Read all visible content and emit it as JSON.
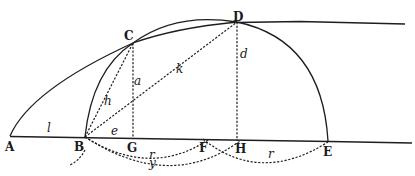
{
  "diagram": {
    "type": "geometric-construction",
    "points": [
      {
        "id": "A",
        "label": "A",
        "x": 10,
        "y": 137
      },
      {
        "id": "B",
        "label": "B",
        "x": 85,
        "y": 137
      },
      {
        "id": "G",
        "label": "G",
        "x": 133,
        "y": 139
      },
      {
        "id": "F",
        "label": "F",
        "x": 206,
        "y": 139
      },
      {
        "id": "H",
        "label": "H",
        "x": 237,
        "y": 141
      },
      {
        "id": "E",
        "label": "E",
        "x": 327,
        "y": 142
      },
      {
        "id": "C",
        "label": "C",
        "x": 133,
        "y": 43
      },
      {
        "id": "D",
        "label": "D",
        "x": 237,
        "y": 22
      }
    ],
    "segment_labels": {
      "l": "l",
      "e": "e",
      "a": "a",
      "h": "h",
      "k": "k",
      "d": "d",
      "r_left": "r",
      "r_right": "r",
      "y": "y"
    },
    "elements": [
      {
        "kind": "line",
        "style": "solid",
        "from": "A",
        "to": "baseline-end",
        "description": "horizontal baseline"
      },
      {
        "kind": "line",
        "style": "solid",
        "from": "D",
        "to": "top-line-end",
        "description": "horizontal line through D"
      },
      {
        "kind": "curve",
        "style": "solid",
        "from": "A",
        "to": "C",
        "description": "parabolic curve A to C continuing to D"
      },
      {
        "kind": "curve",
        "style": "solid",
        "from": "B",
        "to": "E",
        "description": "semicircle through C and D"
      },
      {
        "kind": "curve",
        "style": "solid",
        "from": "C",
        "to": "D",
        "description": "inner arc C to D"
      },
      {
        "kind": "line",
        "style": "dashed",
        "from": "B",
        "to": "C",
        "label": "h"
      },
      {
        "kind": "line",
        "style": "dashed",
        "from": "C",
        "to": "G",
        "label": "a"
      },
      {
        "kind": "line",
        "style": "dashed",
        "from": "B",
        "to": "D",
        "label": "k"
      },
      {
        "kind": "line",
        "style": "dashed",
        "from": "D",
        "to": "H",
        "label": "d"
      },
      {
        "kind": "arc",
        "style": "dashed",
        "from": "B",
        "to": "F",
        "label": "r"
      },
      {
        "kind": "arc",
        "style": "dashed",
        "from": "B",
        "to": "H",
        "label": "y"
      },
      {
        "kind": "arc",
        "style": "dashed",
        "from": "F",
        "to": "E",
        "label": "r"
      }
    ]
  }
}
